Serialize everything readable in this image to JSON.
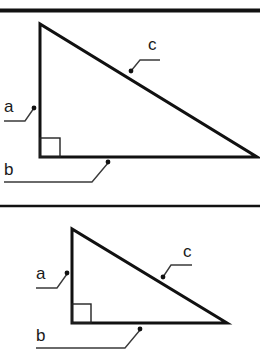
{
  "colors": {
    "line": "#111111",
    "background": "#ffffff"
  },
  "diagrams": [
    {
      "name": "large-right-triangle",
      "labels": {
        "a": "a",
        "b": "b",
        "c": "c"
      }
    },
    {
      "name": "small-right-triangle",
      "labels": {
        "a": "a",
        "b": "b",
        "c": "c"
      }
    }
  ]
}
